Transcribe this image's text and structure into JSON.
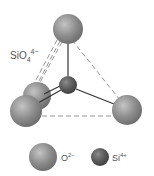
{
  "diagram": {
    "title_label": {
      "base": "SiO",
      "sub": "4",
      "sup": "4−"
    },
    "colors": {
      "oxygen": "#8a8a8a",
      "oxygen_highlight": "#bdbdbd",
      "silicon": "#555555",
      "silicon_highlight": "#8a8a8a",
      "bond_solid": "#333333",
      "bond_dashed": "#888888"
    },
    "atoms": [
      {
        "id": "o-top",
        "element": "O",
        "cx": 68,
        "cy": 29,
        "r": 15
      },
      {
        "id": "si-center",
        "element": "Si",
        "cx": 68,
        "cy": 85,
        "r": 9
      },
      {
        "id": "o-back-left",
        "element": "O",
        "cx": 37,
        "cy": 96,
        "r": 14
      },
      {
        "id": "o-front-left",
        "element": "O",
        "cx": 26,
        "cy": 111,
        "r": 16
      },
      {
        "id": "o-right",
        "element": "O",
        "cx": 127,
        "cy": 110,
        "r": 15
      }
    ],
    "bonds": [
      {
        "from": "si-center",
        "to": "o-top",
        "style": "solid"
      },
      {
        "from": "si-center",
        "to": "o-back-left",
        "style": "solid"
      },
      {
        "from": "si-center",
        "to": "o-front-left",
        "style": "solid"
      },
      {
        "from": "si-center",
        "to": "o-right",
        "style": "solid"
      }
    ],
    "edges": [
      {
        "from": "o-top",
        "to": "o-right",
        "style": "dashed"
      },
      {
        "from": "o-top",
        "to": "o-back-left",
        "style": "dashed"
      },
      {
        "from": "o-top",
        "to": "o-front-left",
        "style": "dashed"
      },
      {
        "from": "o-front-left",
        "to": "o-right",
        "style": "dashed"
      }
    ],
    "legend": [
      {
        "element": "O",
        "label_base": "O",
        "label_sup": "2−"
      },
      {
        "element": "Si",
        "label_base": "Si",
        "label_sup": "4+"
      }
    ]
  }
}
